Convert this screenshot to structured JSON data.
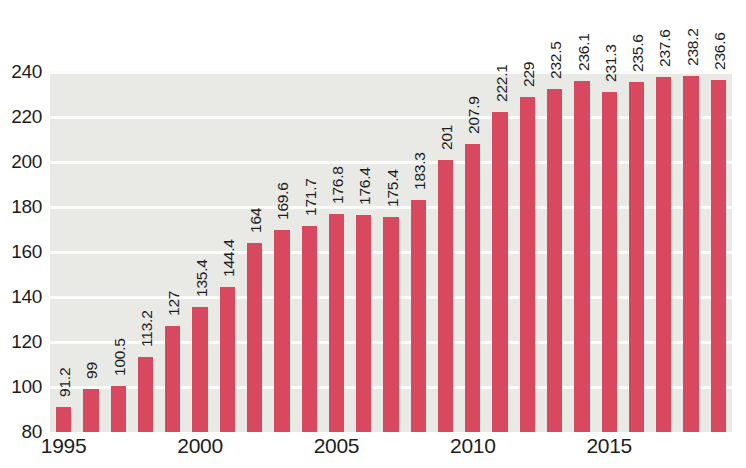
{
  "chart_data": {
    "type": "bar",
    "title": "",
    "subtitle": "",
    "xlabel": "",
    "ylabel": "",
    "ylim": [
      80,
      240
    ],
    "ytick_step": 20,
    "ytick_labels": [
      "240",
      "220",
      "200",
      "180",
      "160",
      "140",
      "120",
      "100",
      "80"
    ],
    "ytick_values": [
      240,
      220,
      200,
      180,
      160,
      140,
      120,
      100,
      80
    ],
    "grid": true,
    "grid_axis": "y",
    "legend": null,
    "legend_position": "none",
    "bar_color": "#d8485f",
    "plot_background": "#e9e9e6",
    "gridline_color": "#fbfbfa",
    "label_orientation": "vertical",
    "categories": [
      "1995",
      "1996",
      "1997",
      "1998",
      "1999",
      "2000",
      "2001",
      "2002",
      "2003",
      "2004",
      "2005",
      "2006",
      "2007",
      "2008",
      "2009",
      "2010",
      "2011",
      "2012",
      "2013",
      "2014",
      "2015",
      "2016",
      "2017",
      "2018",
      "2019"
    ],
    "values": [
      91.2,
      99,
      100.5,
      113.2,
      127,
      135.4,
      144.4,
      164,
      169.6,
      171.7,
      176.8,
      176.4,
      175.4,
      183.3,
      201,
      207.9,
      222.1,
      229,
      232.5,
      236.1,
      231.3,
      235.6,
      237.6,
      238.2,
      236.6
    ],
    "value_labels": [
      "91.2",
      "99",
      "100.5",
      "113.2",
      "127",
      "135.4",
      "144.4",
      "164",
      "169.6",
      "171.7",
      "176.8",
      "176.4",
      "175.4",
      "183.3",
      "201",
      "207.9",
      "222.1",
      "229",
      "232.5",
      "236.1",
      "231.3",
      "235.6",
      "237.6",
      "238.2",
      "236.6"
    ],
    "xtick_labels": [
      "1995",
      "2000",
      "2005",
      "2010",
      "2015"
    ],
    "xtick_indices": [
      0,
      5,
      10,
      15,
      20
    ]
  }
}
